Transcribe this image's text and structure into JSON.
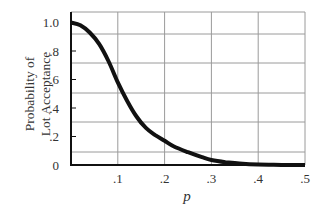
{
  "chart_data": {
    "type": "line",
    "title": "",
    "xlabel": "p",
    "ylabel": "Probability of Lot Acceptance",
    "ylabel_lines": [
      "Probability of",
      "Lot Acceptance"
    ],
    "xlim": [
      0,
      0.5
    ],
    "ylim": [
      0,
      1.0
    ],
    "grid": true,
    "legend": null,
    "x_ticks": [
      0.1,
      0.2,
      0.3,
      0.4,
      0.5
    ],
    "x_tick_labels": [
      ".1",
      ".2",
      ".3",
      ".4",
      ".5"
    ],
    "y_ticks": [
      0,
      0.2,
      0.4,
      0.6,
      0.8,
      1.0
    ],
    "y_tick_labels": [
      "0",
      ".2",
      ".4",
      ".6",
      ".8",
      "1.0"
    ],
    "series": [
      {
        "name": "OC curve",
        "color": "#111111",
        "x": [
          0,
          0.02,
          0.04,
          0.06,
          0.08,
          0.1,
          0.12,
          0.14,
          0.16,
          0.18,
          0.2,
          0.22,
          0.25,
          0.28,
          0.3,
          0.33,
          0.36,
          0.4,
          0.45,
          0.5
        ],
        "y": [
          1.0,
          0.98,
          0.93,
          0.85,
          0.73,
          0.58,
          0.45,
          0.34,
          0.26,
          0.21,
          0.17,
          0.13,
          0.09,
          0.055,
          0.035,
          0.02,
          0.01,
          0.003,
          0.001,
          0.0
        ]
      }
    ]
  }
}
